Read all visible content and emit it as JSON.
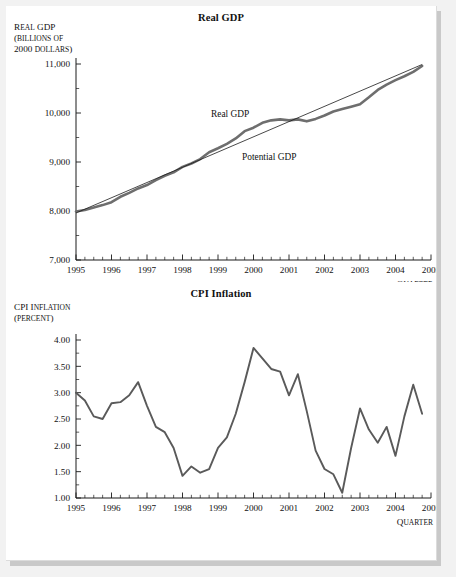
{
  "page": {
    "background": "#f2f2f2",
    "sheet_color": "#ffffff"
  },
  "figures": [
    {
      "id": "real-gdp",
      "title": "Real GDP",
      "y_caption_lines": [
        "Real GDP",
        "(billions of",
        "2000 dollars)"
      ],
      "x_caption": "Quarter",
      "series_labels": {
        "real": "Real GDP",
        "potential": "Potential GDP"
      }
    },
    {
      "id": "cpi-inflation",
      "title": "CPI Inflation",
      "y_caption_lines": [
        "CPI Inflation",
        "(percent)"
      ],
      "x_caption": "Quarter",
      "series_labels": {
        "cpi": "CPI Inflation"
      }
    }
  ],
  "chart_data": [
    {
      "type": "line",
      "title": "Real GDP",
      "xlabel": "Quarter",
      "ylabel": "Real GDP (billions of 2000 dollars)",
      "xlim": [
        1995,
        2005
      ],
      "ylim": [
        7000,
        11000
      ],
      "yticks": [
        7000,
        8000,
        9000,
        10000,
        11000
      ],
      "ytick_labels": [
        "7,000",
        "8,000",
        "9,000",
        "10,000",
        "11,000"
      ],
      "xticks": [
        1995,
        1996,
        1997,
        1998,
        1999,
        2000,
        2001,
        2002,
        2003,
        2004,
        2005
      ],
      "xtick_labels": [
        "1995",
        "1996",
        "1997",
        "1998",
        "1999",
        "2000",
        "2001",
        "2002",
        "2003",
        "2004",
        "2005"
      ],
      "minor_ticks_per_interval": 4,
      "grid": false,
      "legend": "inline-annotation",
      "series": [
        {
          "name": "Real GDP",
          "color": "#6e6e6e",
          "x": [
            1995.0,
            1995.25,
            1995.5,
            1995.75,
            1996.0,
            1996.25,
            1996.5,
            1996.75,
            1997.0,
            1997.25,
            1997.5,
            1997.75,
            1998.0,
            1998.25,
            1998.5,
            1998.75,
            1999.0,
            1999.25,
            1999.5,
            1999.75,
            2000.0,
            2000.25,
            2000.5,
            2000.75,
            2001.0,
            2001.25,
            2001.5,
            2001.75,
            2002.0,
            2002.25,
            2002.5,
            2002.75,
            2003.0,
            2003.25,
            2003.5,
            2003.75,
            2004.0,
            2004.25,
            2004.5,
            2004.75
          ],
          "values": [
            7990,
            8020,
            8070,
            8120,
            8180,
            8290,
            8370,
            8460,
            8530,
            8630,
            8720,
            8790,
            8900,
            8970,
            9060,
            9200,
            9280,
            9370,
            9480,
            9630,
            9700,
            9800,
            9850,
            9870,
            9850,
            9870,
            9830,
            9880,
            9950,
            10030,
            10080,
            10130,
            10180,
            10320,
            10470,
            10580,
            10670,
            10750,
            10840,
            10960
          ]
        },
        {
          "name": "Potential GDP",
          "color": "#1a1a1a",
          "x": [
            1995.0,
            2004.75
          ],
          "values": [
            7960,
            10990
          ]
        }
      ]
    },
    {
      "type": "line",
      "title": "CPI Inflation",
      "xlabel": "Quarter",
      "ylabel": "CPI Inflation (percent)",
      "xlim": [
        1995,
        2005
      ],
      "ylim": [
        1.0,
        4.0
      ],
      "yticks": [
        1.0,
        1.5,
        2.0,
        2.5,
        3.0,
        3.5,
        4.0
      ],
      "ytick_labels": [
        "1.00",
        "1.50",
        "2.00",
        "2.50",
        "3.00",
        "3.50",
        "4.00"
      ],
      "xticks": [
        1995,
        1996,
        1997,
        1998,
        1999,
        2000,
        2001,
        2002,
        2003,
        2004,
        2005
      ],
      "xtick_labels": [
        "1995",
        "1996",
        "1997",
        "1998",
        "1999",
        "2000",
        "2001",
        "2002",
        "2003",
        "2004",
        "2005"
      ],
      "minor_ticks_per_interval": 4,
      "grid": false,
      "legend": "none",
      "series": [
        {
          "name": "CPI Inflation",
          "color": "#5a5a5a",
          "x": [
            1995.0,
            1995.25,
            1995.5,
            1995.75,
            1996.0,
            1996.25,
            1996.5,
            1996.75,
            1997.0,
            1997.25,
            1997.5,
            1997.75,
            1998.0,
            1998.25,
            1998.5,
            1998.75,
            1999.0,
            1999.25,
            1999.5,
            1999.75,
            2000.0,
            2000.25,
            2000.5,
            2000.75,
            2001.0,
            2001.25,
            2001.5,
            2001.75,
            2002.0,
            2002.25,
            2002.5,
            2002.75,
            2003.0,
            2003.25,
            2003.5,
            2003.75,
            2004.0,
            2004.25,
            2004.5,
            2004.75
          ],
          "values": [
            3.0,
            2.85,
            2.55,
            2.5,
            2.8,
            2.82,
            2.95,
            3.2,
            2.75,
            2.35,
            2.25,
            1.95,
            1.42,
            1.6,
            1.48,
            1.55,
            1.95,
            2.15,
            2.6,
            3.2,
            3.85,
            3.65,
            3.45,
            3.4,
            2.95,
            3.35,
            2.65,
            1.9,
            1.55,
            1.45,
            1.1,
            1.95,
            2.7,
            2.3,
            2.05,
            2.35,
            1.8,
            2.55,
            3.15,
            2.6,
            3.2
          ]
        }
      ]
    }
  ]
}
